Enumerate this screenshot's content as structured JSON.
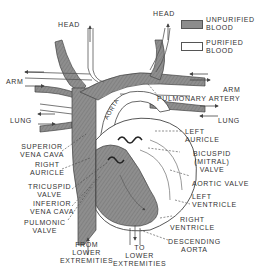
{
  "diagram": {
    "colors": {
      "unpurified": "#8c8c8c",
      "purified": "#ffffff",
      "outline": "#444444",
      "text": "#333333"
    },
    "legend": [
      {
        "label": "UNPURIFIED\nBLOOD",
        "swatch": "unpurified"
      },
      {
        "label": "PURIFIED\nBLOOD",
        "swatch": "purified"
      }
    ],
    "labels": {
      "head_left": "HEAD",
      "head_right": "HEAD",
      "arm_left": "ARM",
      "arm_right": "ARM",
      "lung_left": "LUNG",
      "lung_right": "LUNG",
      "aorta": "AORTA",
      "pulmonary_artery": "PULMONARY ARTERY",
      "superior_vena_cava": "SUPERIOR\nVENA CAVA",
      "right_auricle": "RIGHT\nAURICLE",
      "left_auricle": "LEFT\nAURICLE",
      "bicuspid_valve": "BICUSPID\n(MITRAL)\nVALVE",
      "aortic_valve": "AORTIC VALVE",
      "tricuspid_valve": "TRICUSPID\nVALVE",
      "left_ventricle": "LEFT\nVENTRICLE",
      "inferior_vena_cava": "INFERIOR\nVENA CAVA",
      "right_ventricle": "RIGHT\nVENTRICLE",
      "pulmonic_valve": "PULMONIC\nVALVE",
      "descending_aorta": "DESCENDING\nAORTA",
      "from_lower_extremities": "FROM\nLOWER\nEXTREMITIES",
      "to_lower_extremities": "TO\nLOWER\nEXTREMITIES"
    }
  }
}
